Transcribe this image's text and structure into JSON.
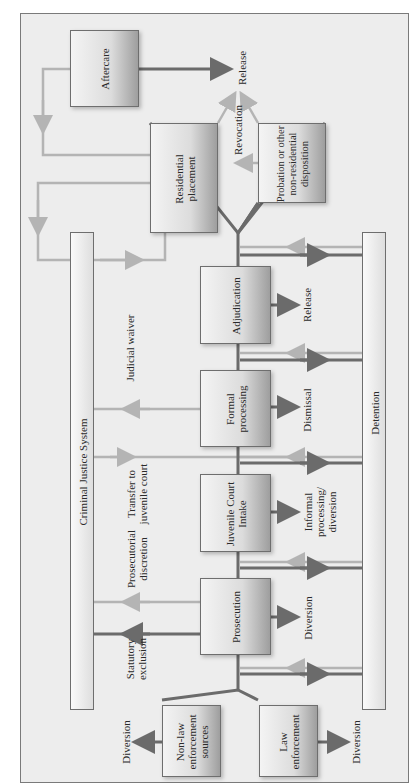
{
  "diagram": {
    "orientation": "rotated-90-ccw",
    "colors": {
      "dark_arrow": "#6b6b6b",
      "light_arrow": "#b4b4b4",
      "background": "#ededed",
      "border": "#6e6e6e"
    },
    "boxes": {
      "aftercare": "Aftercare",
      "residential_placement": "Residential placement",
      "probation": "Probation or other non-residential disposition",
      "adjudication": "Adjudication",
      "formal_processing": "Formal processing",
      "juvenile_court_intake": "Juvenile Court Intake",
      "prosecution": "Prosecution",
      "non_law_enforcement": "Non-law enforcement sources",
      "law_enforcement": "Law enforcement"
    },
    "bars": {
      "criminal_justice_system": "Criminal Justice System",
      "detention": "Detention"
    },
    "labels": {
      "release_top": "Release",
      "revocation": "Revocation",
      "release_adjudication": "Release",
      "judicial_waiver": "Judicial waiver",
      "dismissal": "Dismissal",
      "transfer": "Transfer to juvenile court",
      "informal": "Informal processing/ diversion",
      "prosecutorial_discretion": "Prosecutorial discretion",
      "diversion_prosecution": "Diversion",
      "statutory_exclusion": "Statutory exclusion",
      "diversion_non_law": "Diversion",
      "diversion_law": "Diversion"
    }
  }
}
